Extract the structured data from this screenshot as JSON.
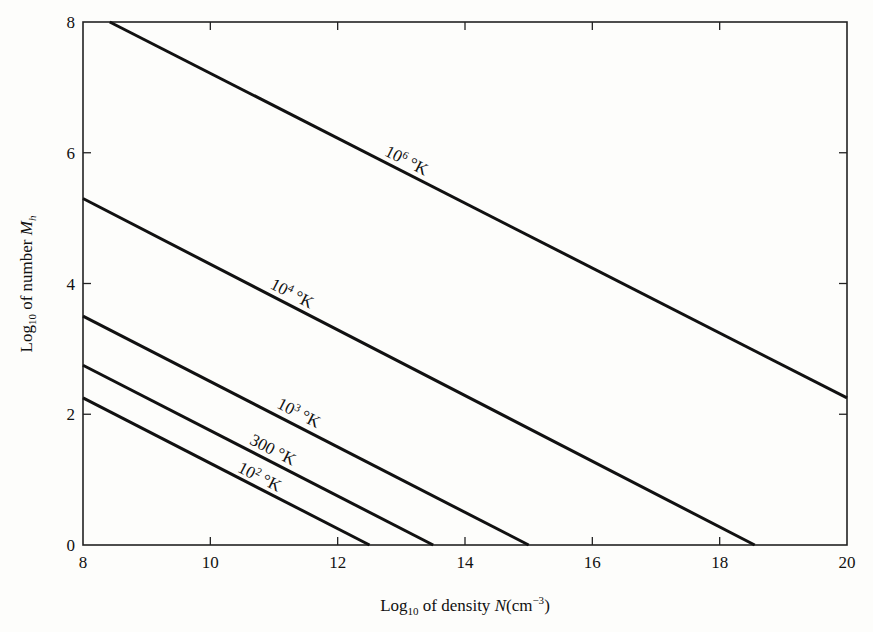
{
  "chart_data": {
    "type": "line",
    "title": "",
    "xlabel": "Log10 of density N(cm−3)",
    "ylabel": "Log10 of number Mh",
    "xlim": [
      8,
      20
    ],
    "ylim": [
      0,
      8
    ],
    "x_ticks": [
      8,
      10,
      12,
      14,
      16,
      18,
      20
    ],
    "y_ticks": [
      0,
      2,
      4,
      6,
      8
    ],
    "grid": false,
    "legend": "inline labels on curves",
    "series": [
      {
        "name": "10^6 °K",
        "label_base": "10",
        "label_exp": "6",
        "label_unit": " °K",
        "x": [
          8.42,
          20
        ],
        "y": [
          8,
          2.25
        ]
      },
      {
        "name": "10^4 °K",
        "label_base": "10",
        "label_exp": "4",
        "label_unit": " °K",
        "x": [
          8,
          18.55
        ],
        "y": [
          5.3,
          0
        ]
      },
      {
        "name": "10^3 °K",
        "label_base": "10",
        "label_exp": "3",
        "label_unit": " °K",
        "x": [
          8,
          15.0
        ],
        "y": [
          3.5,
          0
        ]
      },
      {
        "name": "300 °K",
        "label_base": "300",
        "label_exp": "",
        "label_unit": " °K",
        "x": [
          8,
          13.5
        ],
        "y": [
          2.75,
          0
        ]
      },
      {
        "name": "10^2 °K",
        "label_base": "10",
        "label_exp": "2",
        "label_unit": " °K",
        "x": [
          8,
          12.5
        ],
        "y": [
          2.25,
          0
        ]
      }
    ]
  },
  "axes": {
    "x_title_main": "Log",
    "x_title_sub": "10",
    "x_title_rest": " of density ",
    "x_title_var": "N",
    "x_title_unit_open": "(cm",
    "x_title_unit_exp": "−3",
    "x_title_unit_close": ")",
    "y_title_main": "Log",
    "y_title_sub": "10",
    "y_title_rest": " of number ",
    "y_title_var": "M",
    "y_title_var_sub": "h"
  }
}
